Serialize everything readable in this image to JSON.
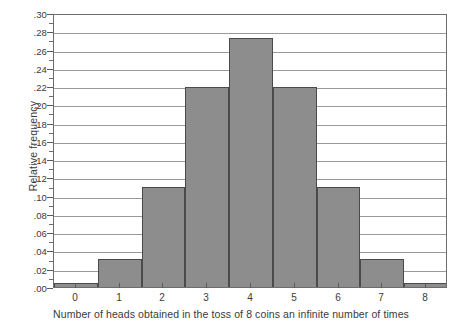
{
  "chart_data": {
    "type": "bar",
    "title": "",
    "xlabel": "Number of heads obtained in the toss of 8 coins an infinite number of times",
    "ylabel": "Relative frequency",
    "categories": [
      "0",
      "1",
      "2",
      "3",
      "4",
      "5",
      "6",
      "7",
      "8"
    ],
    "values": [
      0.004,
      0.031,
      0.109,
      0.219,
      0.273,
      0.219,
      0.109,
      0.031,
      0.004
    ],
    "xlim": [
      -0.5,
      8.5
    ],
    "ylim": [
      0.0,
      0.3
    ],
    "ytick_labels": [
      ".00",
      ".02",
      ".04",
      ".06",
      ".08",
      ".10",
      ".12",
      ".14",
      ".16",
      ".18",
      ".20",
      ".22",
      ".24",
      ".26",
      ".28",
      ".30"
    ],
    "ytick_values": [
      0.0,
      0.02,
      0.04,
      0.06,
      0.08,
      0.1,
      0.12,
      0.14,
      0.16,
      0.18,
      0.2,
      0.22,
      0.24,
      0.26,
      0.28,
      0.3
    ],
    "ytick_minor_values": [
      0.01,
      0.03,
      0.05,
      0.07,
      0.09,
      0.11,
      0.13,
      0.15,
      0.17,
      0.19,
      0.21,
      0.23,
      0.25,
      0.27,
      0.29
    ],
    "grid": true,
    "grid_axis": "y",
    "legend": false,
    "bar_color": "#8d8d8d",
    "bar_edge_color": "#4a4a4a",
    "grid_color": "#9a9a9a",
    "axis_color": "#6d6d6d",
    "background": "#ffffff"
  }
}
